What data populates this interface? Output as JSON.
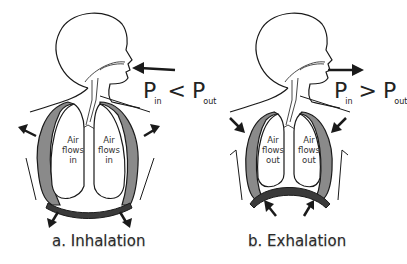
{
  "panels": [
    {
      "id": "inhalation",
      "caption": "a. Inhalation",
      "lung_left_text": [
        "Air",
        "flows",
        "in"
      ],
      "lung_right_text": [
        "Air",
        "flows",
        "in"
      ],
      "pressure": {
        "left": "P",
        "left_sub": "in",
        "operator": "<",
        "right": "P",
        "right_sub": "out"
      },
      "mouth_arrow_direction": "inward"
    },
    {
      "id": "exhalation",
      "caption": "b. Exhalation",
      "lung_left_text": [
        "Air",
        "flows",
        "out"
      ],
      "lung_right_text": [
        "Air",
        "flows",
        "out"
      ],
      "pressure": {
        "left": "P",
        "left_sub": "in",
        "operator": ">",
        "right": "P",
        "right_sub": "out"
      },
      "mouth_arrow_direction": "outward"
    }
  ],
  "colors": {
    "outline": "#1a1a1a",
    "pleura": "#8a8a8a",
    "diaphragm": "#3a3a3a",
    "background": "#ffffff"
  }
}
